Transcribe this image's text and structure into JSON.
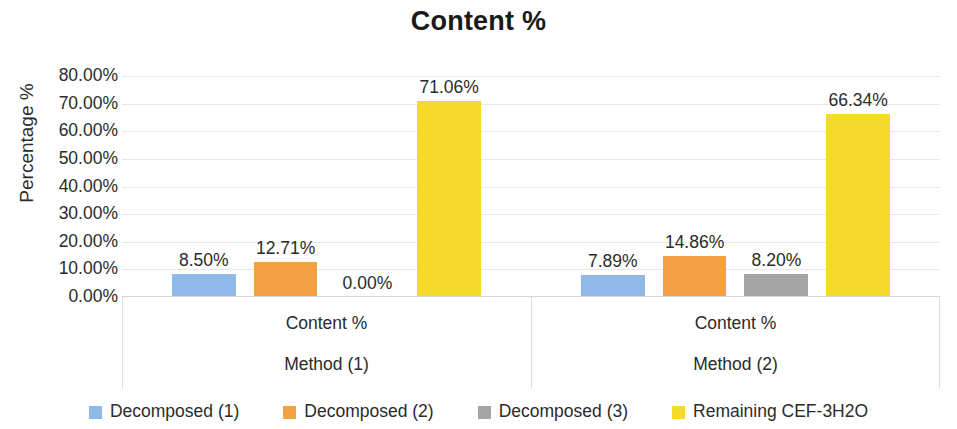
{
  "chart_data": {
    "type": "bar",
    "title": "Content %",
    "xlabel": "",
    "ylabel": "Percentage %",
    "ylim": [
      0,
      80
    ],
    "ytick_labels": [
      "80.00%",
      "70.00%",
      "60.00%",
      "50.00%",
      "40.00%",
      "30.00%",
      "20.00%",
      "10.00%",
      "0.00%"
    ],
    "ytick_values": [
      80,
      70,
      60,
      50,
      40,
      30,
      20,
      10,
      0
    ],
    "grid": true,
    "legend_position": "bottom",
    "categories": [
      "Method (1)",
      "Method (2)"
    ],
    "category_sublabel": "Content %",
    "series": [
      {
        "name": "Decomposed (1)",
        "color": "#8FB9E8",
        "values": [
          8.5,
          7.89
        ],
        "labels": [
          "8.50%",
          "7.89%"
        ]
      },
      {
        "name": "Decomposed (2)",
        "color": "#F4A145",
        "values": [
          12.71,
          14.86
        ],
        "labels": [
          "12.71%",
          "14.86%"
        ]
      },
      {
        "name": "Decomposed (3)",
        "color": "#A5A5A5",
        "values": [
          0.0,
          8.2
        ],
        "labels": [
          "0.00%",
          "8.20%"
        ]
      },
      {
        "name": "Remaining CEF-3H2O",
        "color": "#F5D92C",
        "values": [
          71.06,
          66.34
        ],
        "labels": [
          "71.06%",
          "66.34%"
        ]
      }
    ]
  }
}
